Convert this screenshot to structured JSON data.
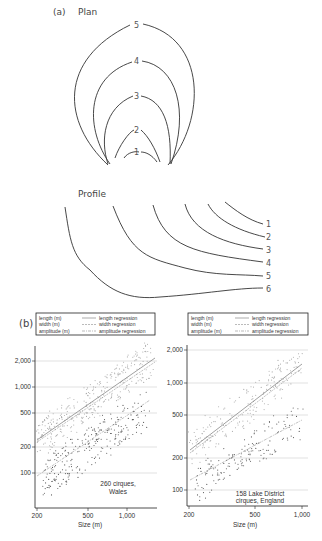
{
  "panel_a": {
    "label": "(a)",
    "plan_title": "Plan",
    "plan_labels": [
      "1",
      "2",
      "3",
      "4",
      "5"
    ],
    "profile_title": "Profile",
    "profile_labels": [
      "1",
      "2",
      "3",
      "4",
      "5",
      "6"
    ]
  },
  "panel_b": {
    "label": "(b)",
    "legend": {
      "points": [
        "length (m)",
        "width (m)",
        "amplitude (m)"
      ],
      "lines": [
        "length regression",
        "width regression",
        "amplitude regression"
      ]
    }
  },
  "chart_data": [
    {
      "type": "scatter",
      "title": "",
      "annotation": "260 cirques, Wales",
      "annotation_line1": "260 cirques,",
      "annotation_line2": "Wales",
      "xlabel": "Size (m)",
      "ylabel": "",
      "x_scale": "log",
      "y_scale": "log",
      "x_ticks": [
        "200",
        "500",
        "1,000"
      ],
      "y_ticks": [
        "100",
        "200",
        "500",
        "1,000",
        "2,000"
      ],
      "xlim": [
        190,
        1800
      ],
      "ylim": [
        60,
        2600
      ],
      "grid": "horizontal",
      "legend_position": "top",
      "series": [
        {
          "name": "length (m)",
          "marker": "dot-light",
          "x_range": [
            200,
            1500
          ],
          "y_range": [
            240,
            2200
          ]
        },
        {
          "name": "width (m)",
          "marker": "dot-light",
          "x_range": [
            200,
            1500
          ],
          "y_range": [
            250,
            2000
          ]
        },
        {
          "name": "amplitude (m)",
          "marker": "dot-dark",
          "x_range": [
            200,
            1400
          ],
          "y_range": [
            70,
            600
          ]
        },
        {
          "name": "length regression",
          "style": "solid",
          "x": [
            200,
            1700
          ],
          "y": [
            260,
            2300
          ]
        },
        {
          "name": "width regression",
          "style": "dashed",
          "x": [
            200,
            1700
          ],
          "y": [
            240,
            2100
          ]
        },
        {
          "name": "amplitude regression",
          "style": "dash-dot",
          "x": [
            200,
            1700
          ],
          "y": [
            95,
            800
          ]
        }
      ]
    },
    {
      "type": "scatter",
      "title": "",
      "annotation": "158 Lake District cirques, England",
      "annotation_line1": "158 Lake District",
      "annotation_line2": "cirques, England",
      "xlabel": "Size (m)",
      "ylabel": "",
      "x_scale": "log",
      "y_scale": "log",
      "x_ticks": [
        "200",
        "500",
        "1,000"
      ],
      "y_ticks": [
        "100",
        "200",
        "500",
        "1,000",
        "2,000"
      ],
      "xlim": [
        190,
        1050
      ],
      "ylim": [
        75,
        2100
      ],
      "grid": "horizontal",
      "legend_position": "top",
      "series": [
        {
          "name": "length (m)",
          "marker": "dot-light",
          "x_range": [
            200,
            1000
          ],
          "y_range": [
            220,
            1700
          ]
        },
        {
          "name": "width (m)",
          "marker": "dot-light",
          "x_range": [
            200,
            1000
          ],
          "y_range": [
            220,
            1500
          ]
        },
        {
          "name": "amplitude (m)",
          "marker": "dot-dark",
          "x_range": [
            200,
            980
          ],
          "y_range": [
            80,
            550
          ]
        },
        {
          "name": "length regression",
          "style": "solid",
          "x": [
            200,
            1000
          ],
          "y": [
            230,
            1550
          ]
        },
        {
          "name": "width regression",
          "style": "dashed",
          "x": [
            200,
            1000
          ],
          "y": [
            215,
            1400
          ]
        },
        {
          "name": "amplitude regression",
          "style": "dash-dot",
          "x": [
            200,
            1000
          ],
          "y": [
            120,
            420
          ]
        }
      ]
    }
  ]
}
